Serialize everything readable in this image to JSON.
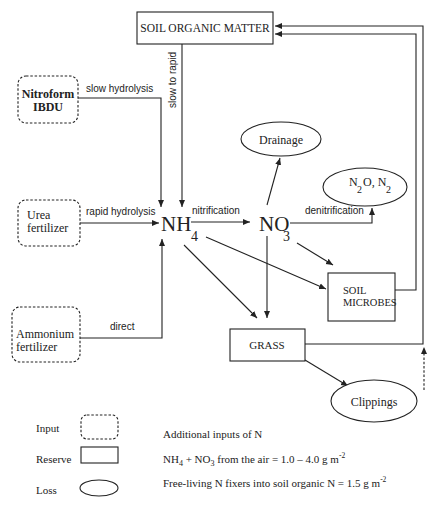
{
  "nodes": {
    "soil_organic_matter": {
      "label": "SOIL ORGANIC MATTER",
      "type": "reserve"
    },
    "nitroform": {
      "line1": "Nitroform",
      "line2": "IBDU",
      "type": "input"
    },
    "urea": {
      "line1": "Urea",
      "line2": "fertilizer",
      "type": "input"
    },
    "ammonium": {
      "line1": "Ammonium",
      "line2": "fertilizer",
      "type": "input"
    },
    "nh4": {
      "main": "NH",
      "sub": "4"
    },
    "no3": {
      "main": "NO",
      "sub": "3"
    },
    "drainage": {
      "label": "Drainage",
      "type": "loss"
    },
    "n2o_n2": {
      "a": "N",
      "a_sub": "2",
      "b": "O, N",
      "b_sub": "2",
      "type": "loss"
    },
    "soil_microbes": {
      "line1": "SOIL",
      "line2": "MICROBES",
      "type": "reserve"
    },
    "grass": {
      "label": "GRASS",
      "type": "reserve"
    },
    "clippings": {
      "label": "Clippings",
      "type": "loss"
    }
  },
  "edges": {
    "slow_hydrolysis": "slow hydrolysis",
    "slow_to_rapid": "slow to rapid",
    "rapid_hydrolysis": "rapid hydrolysis",
    "direct": "direct",
    "nitrification": "nitrification",
    "denitrification": "denitrification"
  },
  "legend": {
    "input": "Input",
    "reserve": "Reserve",
    "loss": "Loss"
  },
  "notes": {
    "title": "Additional inputs of N",
    "line1_a": "NH",
    "line1_a_sub": "4",
    "line1_b": " + NO",
    "line1_b_sub": "3",
    "line1_c": " from the air = 1.0 – 4.0  g m",
    "line1_sup": "-2",
    "line2": "Free-living N fixers into soil organic N = 1.5 g m",
    "line2_sup": "-2"
  }
}
